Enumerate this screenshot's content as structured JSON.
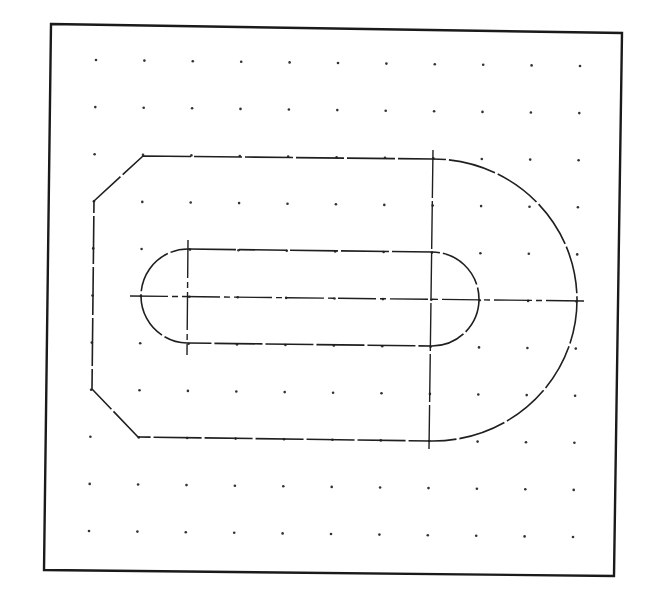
{
  "drawing": {
    "title": "CAD part drawing on dot grid",
    "colors": {
      "background": "#ffffff",
      "line": "#1f1f1f",
      "frame": "#1a1a1a",
      "grid_dot": "#333333"
    },
    "frame": {
      "corners": [
        [
          51,
          24
        ],
        [
          622,
          33
        ],
        [
          614,
          576
        ],
        [
          44,
          570
        ]
      ]
    },
    "grid": {
      "columns": 11,
      "rows": 11,
      "origin": [
        96,
        60
      ],
      "dx": [
        48.4,
        0.6
      ],
      "dy": [
        -0.7,
        47.1
      ],
      "dot_radius": 1.3
    },
    "outer_profile": {
      "description": "Plate with chamfered left corners and semicircular right end",
      "path": "M 143 156 L 433 159 A 144 141 0 0 1 577 300 A 144 141 0 0 1 430 441 L 138 437 L 92 389 L 94 201 Z",
      "dash": "48 3"
    },
    "slot": {
      "description": "Obround slot with two centers",
      "path": "M 188 249 L 432 252 A 47 47 0 0 1 479 299 A 47 47 0 0 1 432 346 L 187 343 A 47 47 0 0 1 141 296 A 47 47 0 0 1 188 249 Z",
      "dash": "48 3"
    },
    "centerlines": [
      {
        "name": "horizontal-axis",
        "x1": 130,
        "y1": 296,
        "x2": 587,
        "y2": 301,
        "dash": "38 4 6 4"
      },
      {
        "name": "left-slot-center-vertical",
        "x1": 188,
        "y1": 240,
        "x2": 187,
        "y2": 355,
        "dash": "38 4 6 4"
      },
      {
        "name": "right-center-vertical",
        "x1": 433,
        "y1": 150,
        "x2": 429,
        "y2": 449,
        "dash": "48 3"
      }
    ]
  }
}
